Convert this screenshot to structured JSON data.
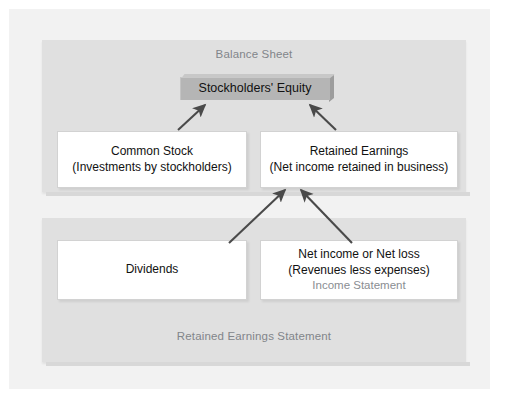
{
  "diagram": {
    "regions": [
      {
        "id": "balance-sheet",
        "caption": "Balance Sheet"
      },
      {
        "id": "retained-earnings-statement",
        "caption": "Retained Earnings Statement"
      }
    ],
    "equity_bar": {
      "label": "Stockholders' Equity",
      "fill_color": "#b5b5b5"
    },
    "boxes": [
      {
        "id": "common-stock",
        "title": "Common Stock",
        "detail": "(Investments by stockholders)",
        "subcaption": ""
      },
      {
        "id": "retained-earnings",
        "title": "Retained Earnings",
        "detail": "(Net income retained in business)",
        "subcaption": ""
      },
      {
        "id": "dividends",
        "title": "Dividends",
        "detail": "",
        "subcaption": ""
      },
      {
        "id": "net-income-or-net-loss",
        "title": "Net income or Net loss",
        "detail": "(Revenues less expenses)",
        "subcaption": "Income Statement"
      }
    ],
    "arrows": [
      {
        "from": "common-stock",
        "to": "stockholders-equity"
      },
      {
        "from": "retained-earnings",
        "to": "stockholders-equity"
      },
      {
        "from": "dividends",
        "to": "retained-earnings"
      },
      {
        "from": "net-income-or-net-loss",
        "to": "retained-earnings"
      }
    ],
    "colors": {
      "page_background": "#ffffff",
      "outer_panel": "#f2f2f2",
      "region_panel": "#e0e0e0",
      "box_fill": "#ffffff",
      "box_border": "#d2d2d2",
      "text_primary": "#111111",
      "text_muted": "#82858a",
      "arrow": "#4a4a4a"
    }
  }
}
